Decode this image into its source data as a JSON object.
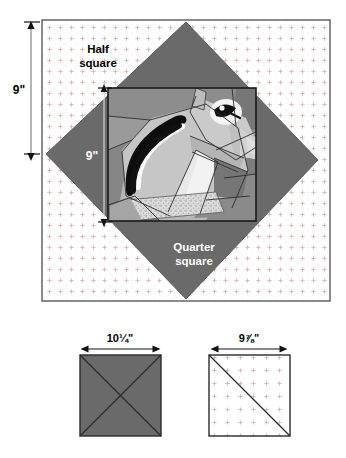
{
  "diagram": {
    "main_panel": {
      "name": "main-setting-panel",
      "background_label": "dotted background fabric",
      "labels": {
        "half_square": "Half\nsquare",
        "half_square_line1": "Half",
        "half_square_line2": "square",
        "quarter_square_line1": "Quarter",
        "quarter_square_line2": "square",
        "outer_dimension": "9\"",
        "inner_dimension": "9\""
      },
      "colors": {
        "background": "#ffffff",
        "panel_border": "#4a4a4a",
        "dot_fabric_dot": "#d8b8b8",
        "setting_triangle": "#6a6a6a",
        "block_border": "#1a1a1a",
        "label_dark": "#000000",
        "label_light": "#ffffff"
      }
    },
    "block": {
      "name": "pieced-squirrel-block",
      "subject": "squirrel",
      "colors": {
        "body_light": "#c9c9c9",
        "body_mid": "#b0b0b0",
        "body_dark": "#8d8d8d",
        "shadow": "#6a6a6a",
        "highlight": "#efefef",
        "white": "#ffffff",
        "black": "#111111",
        "speckle": "#d9d9d9"
      }
    },
    "cutting_squares": [
      {
        "name": "quarter-square-cut",
        "label": "10¼\"",
        "fill": "#6a6a6a",
        "division": "x-cross",
        "division_description": "cut twice diagonally"
      },
      {
        "name": "half-square-cut",
        "label": "9⅞\"",
        "fill": "#ffffff",
        "division": "single-diagonal",
        "division_description": "cut once diagonally"
      }
    ]
  }
}
